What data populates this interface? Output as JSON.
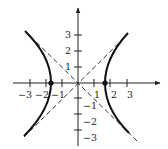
{
  "figure": {
    "type": "hyperbola-graph",
    "equation_shape": "x^2 - y^2 = a^2",
    "vertex_x": 1.73,
    "x_axis": {
      "tick_labels": [
        "−3",
        "−2",
        "−1",
        "1",
        "2",
        "3"
      ],
      "range": [
        -3.5,
        4.5
      ]
    },
    "y_axis": {
      "tick_labels": [
        "3",
        "2",
        "1",
        "−1",
        "−2",
        "−3"
      ],
      "range": [
        -3.5,
        4.5
      ]
    },
    "asymptotes": [
      "y = x",
      "y = -x"
    ],
    "colors": {
      "curve": "#111111",
      "axes": "#222222",
      "asymptote": "#333333"
    }
  }
}
